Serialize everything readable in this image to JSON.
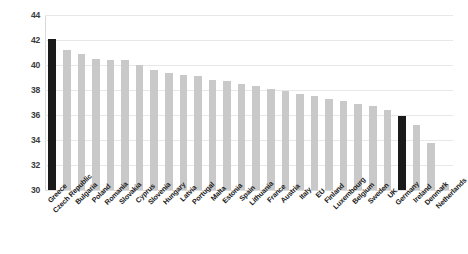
{
  "chart_data": {
    "type": "bar",
    "title": "",
    "subtitle": "",
    "xlabel": "",
    "ylabel": "",
    "ylim": [
      30,
      44
    ],
    "ytick_step": 2,
    "yticks": [
      "44",
      "42",
      "40",
      "38",
      "36",
      "34",
      "32",
      "30"
    ],
    "grid": true,
    "legend": "none",
    "bar_color": "#c9c9c9",
    "highlight_color": "#1a1a1a",
    "highlight_categories": [
      "Greece",
      "Germany"
    ],
    "categories": [
      "Greece",
      "Czech Republic",
      "Bulgaria",
      "Poland",
      "Romania",
      "Slovakia",
      "Cyprus",
      "Slovenia",
      "Hungary",
      "Latvia",
      "Portugal",
      "Malta",
      "Estonia",
      "Spain",
      "Lithuania",
      "France",
      "Austria",
      "Italy",
      "EU",
      "Finland",
      "Luxembourg",
      "Belgium",
      "Sweden",
      "UK",
      "Germany",
      "Ireland",
      "Denmark",
      "Netherlands"
    ],
    "values": [
      42.1,
      41.2,
      40.9,
      40.5,
      40.4,
      40.4,
      40.0,
      39.6,
      39.4,
      39.2,
      39.1,
      38.8,
      38.7,
      38.5,
      38.3,
      38.1,
      37.9,
      37.7,
      37.5,
      37.3,
      37.1,
      36.9,
      36.7,
      36.4,
      35.9,
      35.2,
      33.8,
      30.4
    ]
  }
}
